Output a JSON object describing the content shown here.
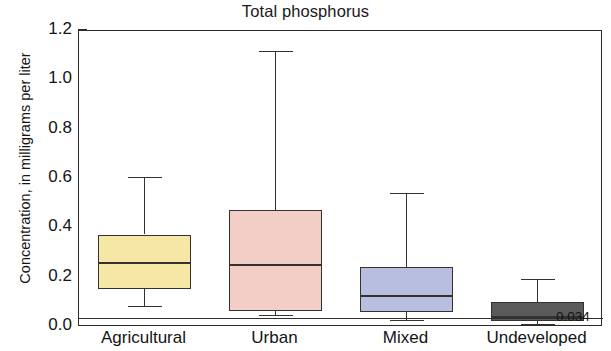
{
  "chart_data": {
    "type": "box",
    "title": "Total phosphorus",
    "xlabel": "",
    "ylabel": "Concentration, in milligrams per liter",
    "ylim": [
      0.0,
      1.2
    ],
    "ytick_step": 0.2,
    "yticks": [
      "0.0",
      "0.2",
      "0.4",
      "0.6",
      "0.8",
      "1.0",
      "1.2"
    ],
    "ytick_values": [
      0.0,
      0.2,
      0.4,
      0.6,
      0.8,
      1.0,
      1.2
    ],
    "yminor_values": [
      0.1,
      0.3,
      0.5,
      0.7,
      0.9,
      1.1
    ],
    "grid": false,
    "legend": false,
    "categories": [
      "Agricultural",
      "Urban",
      "Mixed",
      "Undeveloped"
    ],
    "reference_line": {
      "value": 0.034,
      "label": "0.034"
    },
    "boxes": [
      {
        "category": "Agricultural",
        "color": "#F5E8A7",
        "lower_whisker": 0.08,
        "q1": 0.155,
        "median": 0.26,
        "q3": 0.375,
        "upper_whisker": 0.605
      },
      {
        "category": "Urban",
        "color": "#F2CEC6",
        "lower_whisker": 0.045,
        "q1": 0.065,
        "median": 0.25,
        "q3": 0.475,
        "upper_whisker": 1.115
      },
      {
        "category": "Mixed",
        "color": "#B8BEE0",
        "lower_whisker": 0.025,
        "q1": 0.06,
        "median": 0.125,
        "q3": 0.245,
        "upper_whisker": 0.54
      },
      {
        "category": "Undeveloped",
        "color": "#5A5A5A",
        "lower_whisker": 0.01,
        "q1": 0.025,
        "median": 0.04,
        "q3": 0.1,
        "upper_whisker": 0.19
      }
    ],
    "colors": {
      "axis": "#2b2b2b",
      "box_outline": "#35322c",
      "text": "#141414",
      "background": "#ffffff"
    }
  }
}
